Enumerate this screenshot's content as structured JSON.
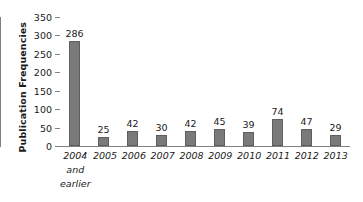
{
  "chart_data": {
    "type": "bar",
    "title": "",
    "subtitle": "",
    "xlabel": "",
    "ylabel": "Publication Frequencies",
    "categories": [
      "2004 and earlier",
      "2005",
      "2006",
      "2007",
      "2008",
      "2009",
      "2010",
      "2011",
      "2012",
      "2013"
    ],
    "category_lines": [
      [
        "2004",
        "and",
        "earlier"
      ],
      [
        "2005"
      ],
      [
        "2006"
      ],
      [
        "2007"
      ],
      [
        "2008"
      ],
      [
        "2009"
      ],
      [
        "2010"
      ],
      [
        "2011"
      ],
      [
        "2012"
      ],
      [
        "2013"
      ]
    ],
    "values": [
      286,
      25,
      42,
      30,
      42,
      45,
      39,
      74,
      47,
      29
    ],
    "data_labels": [
      "286",
      "25",
      "42",
      "30",
      "42",
      "45",
      "39",
      "74",
      "47",
      "29"
    ],
    "ylim": [
      0,
      350
    ],
    "yticks": [
      0,
      50,
      100,
      150,
      200,
      250,
      300,
      350
    ],
    "ytick_labels": [
      "0",
      "50",
      "100",
      "150",
      "200",
      "250",
      "300",
      "350"
    ],
    "grid": false,
    "legend": false,
    "legend_position": "none",
    "bar_color": "#7a7a7a",
    "bar_edge_color": "#5e5e5e",
    "axis_color": "#808080",
    "text_color": "#1a1a1a",
    "background": "#ffffff"
  }
}
